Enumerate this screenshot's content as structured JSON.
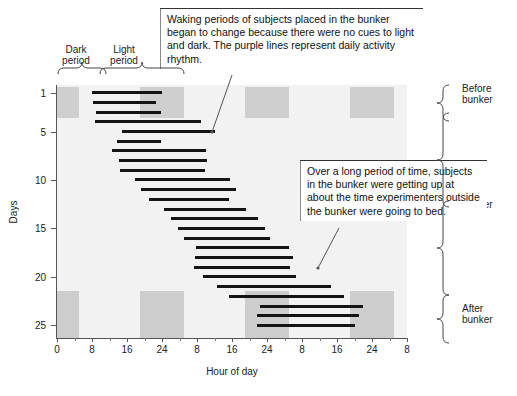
{
  "chart_data": {
    "type": "bar",
    "title": "",
    "xlabel": "Hour of day",
    "ylabel": "Days",
    "xlim": [
      0,
      80
    ],
    "ylim": [
      0.2,
      26.3
    ],
    "grid": false,
    "legend": "none",
    "x_tick_values": [
      0,
      8,
      16,
      24,
      32,
      40,
      48,
      56,
      64,
      72,
      80
    ],
    "x_tick_labels": [
      "0",
      "8",
      "16",
      "24",
      "8",
      "16",
      "24",
      "8",
      "16",
      "24",
      "8"
    ],
    "x_minor_step": 4,
    "y_tick_values": [
      1,
      5,
      10,
      15,
      20,
      25
    ],
    "y_tick_labels": [
      "1",
      "5",
      "10",
      "15",
      "20",
      "25"
    ],
    "shaded_label_dark": "Dark period",
    "shaded_label_light": "Light period",
    "dark_bands_top": [
      {
        "start": 0,
        "end": 5
      },
      {
        "start": 19,
        "end": 29
      },
      {
        "start": 43,
        "end": 53
      },
      {
        "start": 67,
        "end": 77
      }
    ],
    "dark_bands_bottom": [
      {
        "start": 0,
        "end": 5
      },
      {
        "start": 19,
        "end": 29
      },
      {
        "start": 43,
        "end": 53
      },
      {
        "start": 67,
        "end": 77
      }
    ],
    "dark_band_top_days": [
      0.4,
      3.6
    ],
    "dark_band_bottom_days": [
      21.4,
      26.3
    ],
    "bars": [
      {
        "day": 1,
        "start": 8.0,
        "end": 24.0
      },
      {
        "day": 2,
        "start": 8.2,
        "end": 22.6
      },
      {
        "day": 3,
        "start": 9.0,
        "end": 23.7
      },
      {
        "day": 4,
        "start": 8.6,
        "end": 32.8
      },
      {
        "day": 5,
        "start": 14.8,
        "end": 36.0
      },
      {
        "day": 6,
        "start": 13.6,
        "end": 23.8
      },
      {
        "day": 7,
        "start": 12.6,
        "end": 34.0
      },
      {
        "day": 8,
        "start": 14.2,
        "end": 34.2
      },
      {
        "day": 9,
        "start": 14.4,
        "end": 33.8
      },
      {
        "day": 10,
        "start": 17.8,
        "end": 39.6
      },
      {
        "day": 11,
        "start": 19.2,
        "end": 41.0
      },
      {
        "day": 12,
        "start": 21.0,
        "end": 39.4
      },
      {
        "day": 13,
        "start": 24.4,
        "end": 43.2
      },
      {
        "day": 14,
        "start": 26.0,
        "end": 46.0
      },
      {
        "day": 15,
        "start": 27.6,
        "end": 47.6
      },
      {
        "day": 16,
        "start": 29.0,
        "end": 48.6
      },
      {
        "day": 17,
        "start": 31.8,
        "end": 53.0
      },
      {
        "day": 18,
        "start": 31.6,
        "end": 54.0
      },
      {
        "day": 19,
        "start": 31.4,
        "end": 53.2
      },
      {
        "day": 20,
        "start": 33.4,
        "end": 54.6
      },
      {
        "day": 21,
        "start": 36.6,
        "end": 62.6
      },
      {
        "day": 22,
        "start": 39.2,
        "end": 65.6
      },
      {
        "day": 23,
        "start": 46.4,
        "end": 70.0
      },
      {
        "day": 24,
        "start": 45.6,
        "end": 69.0
      },
      {
        "day": 25,
        "start": 45.8,
        "end": 68.2
      }
    ]
  },
  "axes": {
    "x_title": "Hour of day",
    "y_title": "Days",
    "x_labels": [
      "0",
      "8",
      "16",
      "24",
      "8",
      "16",
      "24",
      "8",
      "16",
      "24",
      "8"
    ],
    "y_labels": [
      "1",
      "5",
      "10",
      "15",
      "20",
      "25"
    ]
  },
  "top_labels": {
    "dark": "Dark\nperiod",
    "dark_line1": "Dark",
    "dark_line2": "period",
    "light_line1": "Light",
    "light_line2": "period"
  },
  "side_labels": {
    "before_line1": "Before",
    "before_line2": "bunker",
    "in_line1": "In",
    "in_line2": "bunker",
    "after_line1": "After",
    "after_line2": "bunker"
  },
  "callouts": [
    {
      "id": "callout-1",
      "text": "Waking periods of subjects placed in the bunker began to change because there were no cues to light and dark. The purple lines represent daily activity rhythm."
    },
    {
      "id": "callout-2",
      "text": "Over a long period of time, subjects in the bunker were getting up at about the time experimenters outside the bunker were going to bed."
    }
  ],
  "colors": {
    "background": "#ffffff",
    "plot_background": "#f2f2f2",
    "dark_band": "#cfcfcf",
    "bar": "#141414",
    "axis": "#555555",
    "text": "#1a1a1a"
  }
}
